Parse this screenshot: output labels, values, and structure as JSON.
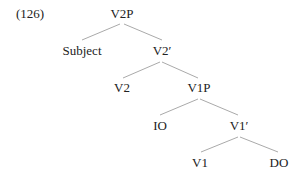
{
  "example_number": "(126)",
  "tree": {
    "nodes": {
      "V2P": "V2P",
      "Subject": "Subject",
      "V2bar": "V2′",
      "V2": "V2",
      "V1P": "V1P",
      "IO": "IO",
      "V1bar": "V1′",
      "V1": "V1",
      "DO": "DO"
    },
    "edges": [
      [
        "V2P",
        "Subject"
      ],
      [
        "V2P",
        "V2bar"
      ],
      [
        "V2bar",
        "V2"
      ],
      [
        "V2bar",
        "V1P"
      ],
      [
        "V1P",
        "IO"
      ],
      [
        "V1P",
        "V1bar"
      ],
      [
        "V1bar",
        "V1"
      ],
      [
        "V1bar",
        "DO"
      ]
    ]
  }
}
